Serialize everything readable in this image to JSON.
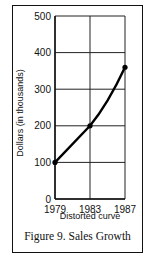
{
  "chart_data": {
    "type": "line",
    "title": "Figure 9. Sales Growth",
    "subtitle": "Distorted curve",
    "xlabel": "",
    "ylabel": "Dollars (in thousands)",
    "categories": [
      "1979",
      "1983",
      "1987"
    ],
    "series": [
      {
        "name": "Sales",
        "values": [
          100,
          200,
          360
        ]
      }
    ],
    "ylim": [
      0,
      500
    ],
    "yticks": [
      0,
      100,
      200,
      300,
      400,
      500
    ],
    "grid": true,
    "legend": "none"
  },
  "labels": {
    "caption": "Figure 9. Sales Growth",
    "subcaption": "Distorted curve",
    "ylabel": "Dollars (in thousands)"
  }
}
